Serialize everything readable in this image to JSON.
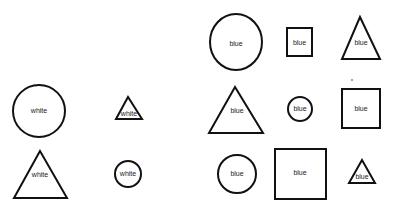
{
  "groups": {
    "left": {
      "shapes": [
        {
          "type": "circle",
          "size": "large",
          "label": "white"
        },
        {
          "type": "triangle",
          "size": "small",
          "label": "white"
        },
        {
          "type": "triangle",
          "size": "large",
          "label": "white"
        },
        {
          "type": "circle",
          "size": "small",
          "label": "white"
        }
      ]
    },
    "right": {
      "shapes": [
        {
          "type": "circle",
          "size": "large",
          "label": "blue"
        },
        {
          "type": "square",
          "size": "small",
          "label": "blue"
        },
        {
          "type": "triangle",
          "size": "medium",
          "label": "blue"
        },
        {
          "type": "triangle",
          "size": "large",
          "label": "blue"
        },
        {
          "type": "circle",
          "size": "small",
          "label": "blue"
        },
        {
          "type": "square",
          "size": "medium",
          "label": "blue"
        },
        {
          "type": "circle",
          "size": "medium",
          "label": "blue"
        },
        {
          "type": "square",
          "size": "large",
          "label": "blue"
        },
        {
          "type": "triangle",
          "size": "small",
          "label": "blue"
        }
      ]
    }
  }
}
